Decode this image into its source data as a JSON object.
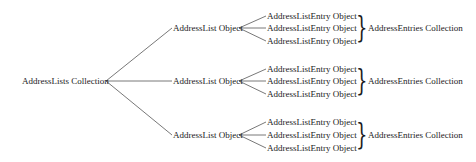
{
  "diagram": {
    "root": {
      "label": "AddressLists Collection"
    },
    "lists": [
      {
        "label": "AddressList Object",
        "entries": [
          "AddressListEntry Object",
          "AddressListEntry Object",
          "AddressListEntry Object"
        ],
        "collection_label": "AddressEntries Collection"
      },
      {
        "label": "AddressList Object",
        "entries": [
          "AddressListEntry Object",
          "AddressListEntry Object",
          "AddressListEntry Object"
        ],
        "collection_label": "AddressEntries Collection"
      },
      {
        "label": "AddressList Object",
        "entries": [
          "AddressListEntry Object",
          "AddressListEntry Object",
          "AddressListEntry Object"
        ],
        "collection_label": "AddressEntries Collection"
      }
    ],
    "brace_glyph": "}",
    "line_color": "#555555"
  }
}
